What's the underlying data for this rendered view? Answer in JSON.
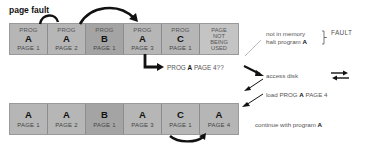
{
  "title": "page fault",
  "top_row": [
    {
      "prog": "PROG",
      "letter": "A",
      "page": "PAGE 1",
      "shade": "normal"
    },
    {
      "prog": "PROG",
      "letter": "A",
      "page": "PAGE 2",
      "shade": "normal"
    },
    {
      "prog": "PROG",
      "letter": "B",
      "page": "PAGE 1",
      "shade": "dark"
    },
    {
      "prog": "PROG",
      "letter": "A",
      "page": "PAGE 3",
      "shade": "normal"
    },
    {
      "prog": "PROG",
      "letter": "C",
      "page": "PAGE 1",
      "shade": "normal"
    },
    {
      "unused": [
        "PAGE",
        "NOT",
        "BEING",
        "USED"
      ],
      "shade": "light"
    }
  ],
  "bottom_row": [
    {
      "letter": "A",
      "page": "PAGE 1",
      "shade": "normal"
    },
    {
      "letter": "A",
      "page": "PAGE 2",
      "shade": "normal"
    },
    {
      "letter": "B",
      "page": "PAGE 1",
      "shade": "dark"
    },
    {
      "letter": "A",
      "page": "PAGE 3",
      "shade": "normal"
    },
    {
      "letter": "C",
      "page": "PAGE 1",
      "shade": "normal"
    },
    {
      "letter": "A",
      "page": "PAGE 4",
      "shade": "normal"
    }
  ],
  "annotations": {
    "request": {
      "prefix": "PROG ",
      "bold": "A",
      "suffix": " PAGE 4??"
    },
    "not_in_memory": "not in memory",
    "halt": {
      "prefix": "halt program ",
      "bold": "A"
    },
    "fault": "FAULT",
    "access_disk": "access disk",
    "load": {
      "prefix": "load PROG ",
      "bold": "A",
      "suffix": " PAGE 4"
    },
    "continue": {
      "prefix": "continue with program ",
      "bold": "A"
    }
  }
}
